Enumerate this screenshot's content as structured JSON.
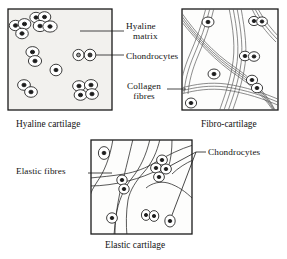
{
  "figure": {
    "panels": [
      {
        "id": "hyaline",
        "caption": "Hyaline cartilage",
        "labels": [
          "Hyaline matrix",
          "Chondrocytes"
        ]
      },
      {
        "id": "fibro",
        "caption": "Fibro-cartilage",
        "labels": [
          "Collagen fibres"
        ]
      },
      {
        "id": "elastic",
        "caption": "Elastic cartilage",
        "labels": [
          "Elastic fibres",
          "Chondrocytes"
        ]
      }
    ]
  },
  "labels": {
    "hyaline_matrix_line1": "Hyaline",
    "hyaline_matrix_line2": "matrix",
    "chondrocytes_hyaline": "Chondrocytes",
    "collagen_fibres_line1": "Collagen",
    "collagen_fibres_line2": "fibres",
    "elastic_fibres": "Elastic fibres",
    "chondrocytes_elastic": "Chondrocytes"
  },
  "captions": {
    "hyaline": "Hyaline cartilage",
    "fibro": "Fibro-cartilage",
    "elastic": "Elastic cartilage"
  },
  "colors": {
    "ink": "#141414",
    "matrix_fill": "#f2f1ee",
    "panel_border": "#1a1a1a",
    "nucleus": "#1c1c1c",
    "fibre": "#4a4a4a",
    "page_background": "#ffffff"
  }
}
